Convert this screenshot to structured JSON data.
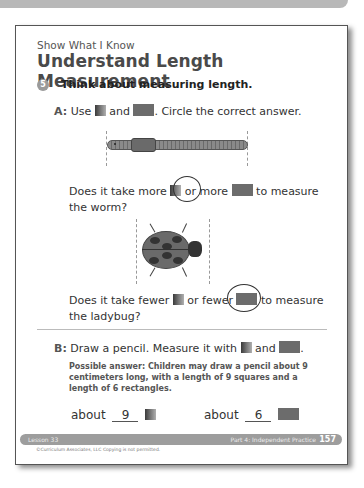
{
  "header": {
    "kicker": "Show What I Know",
    "title": "Understand Length Measurement"
  },
  "question": {
    "number": "5",
    "prompt": "Think about measuring length."
  },
  "part_a": {
    "label": "A:",
    "use_text": "Use",
    "and_text": "and",
    "instruction": ". Circle the correct answer.",
    "q1": {
      "line1_start": "Does it take more",
      "line1_mid": "or more",
      "line1_end": "to measure",
      "line2": "the worm?",
      "circled": "square"
    },
    "q2": {
      "line1_start": "Does it take fewer",
      "line1_mid": "or fewer",
      "line1_end": "to measure",
      "line2": "the ladybug?",
      "circled": "rectangle"
    }
  },
  "part_b": {
    "label": "B:",
    "instruction": "Draw a pencil. Measure it with",
    "and_text": "and",
    "end": ".",
    "possible_answer": "Possible answer: Children may draw a pencil about 9 centimeters long, with a length of 9 squares and a length of 6 rectangles.",
    "about_label": "about",
    "square_count": "9",
    "rectangle_count": "6"
  },
  "footer": {
    "lesson": "Lesson 33",
    "part": "Part 4: Independent Practice",
    "page_number": "157",
    "copyright": "©Curriculum Associates, LLC   Copying is not permitted."
  },
  "icons": {
    "unit_square": "gradient-square-icon",
    "unit_rectangle": "gray-rectangle-icon"
  }
}
